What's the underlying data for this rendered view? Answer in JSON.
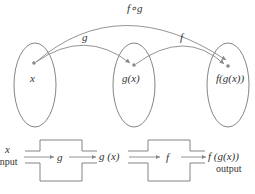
{
  "diagram": {
    "sets": [
      {
        "id": "domain",
        "point_label": "x"
      },
      {
        "id": "intermediate",
        "point_label": "g(x)"
      },
      {
        "id": "codomain",
        "point_label": "f(g(x))"
      }
    ],
    "arrows": [
      {
        "from": "x",
        "to": "g(x)",
        "label": "g"
      },
      {
        "from": "g(x)",
        "to": "f(g(x))",
        "label": "f"
      },
      {
        "from": "x",
        "to": "f(g(x))",
        "label": "f∘g"
      }
    ],
    "machines": {
      "input_value": "x",
      "input_caption": "input",
      "machine1_label": "g",
      "middle_value": "g (x)",
      "machine2_label": "f",
      "output_value": "f (g(x))",
      "output_caption": "output"
    },
    "colors": {
      "stroke": "#777777",
      "point": "#888888",
      "text": "#333333"
    }
  }
}
